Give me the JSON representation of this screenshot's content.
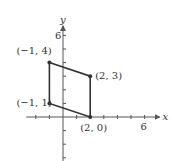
{
  "chart_data": {
    "type": "diagram",
    "title": "",
    "xlabel": "x",
    "ylabel": "y",
    "xlim": [
      -3,
      7
    ],
    "ylim": [
      -4,
      7
    ],
    "x_tick_label": "6",
    "y_tick_label": "6",
    "polygon": {
      "vertices": [
        {
          "x": -1,
          "y": 4,
          "label": "(−1, 4)"
        },
        {
          "x": 2,
          "y": 3,
          "label": "(2, 3)"
        },
        {
          "x": 2,
          "y": 0,
          "label": "(2, 0)"
        },
        {
          "x": -1,
          "y": 1,
          "label": "(−1, 1)"
        }
      ],
      "closed": true,
      "shape": "parallelogram"
    }
  },
  "colors": {
    "line": "#333333",
    "axis": "#555555",
    "background": "#ffffff"
  }
}
